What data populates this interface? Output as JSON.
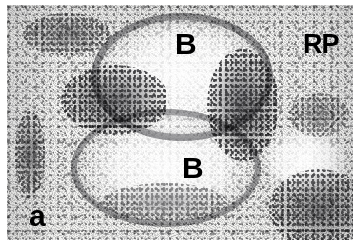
{
  "figure": {
    "panel_label": "a",
    "caption_type": "autoradiograph-micrograph",
    "width_px": 360,
    "height_px": 246,
    "background_color": "#ffffff",
    "plate_tone": "#f4f4f2",
    "grain_color": "#15151a"
  },
  "annotations": [
    {
      "id": "b-top",
      "text": "B",
      "meaning": "B-cell follicle",
      "x": 168,
      "y": 24,
      "font_size": 30
    },
    {
      "id": "rp",
      "text": "RP",
      "meaning": "red pulp",
      "x": 296,
      "y": 26,
      "font_size": 27
    },
    {
      "id": "b-mid",
      "text": "B",
      "meaning": "B-cell follicle",
      "x": 175,
      "y": 148,
      "font_size": 30
    },
    {
      "id": "panel",
      "text": "a",
      "meaning": "panel letter",
      "x": 22,
      "y": 196,
      "font_size": 30
    }
  ],
  "regions": {
    "pale_follicles": [
      {
        "name": "upper-follicle",
        "cx": 175,
        "cy": 72,
        "rx": 78,
        "ry": 56
      },
      {
        "name": "lower-follicle",
        "cx": 160,
        "cy": 165,
        "rx": 82,
        "ry": 52
      }
    ],
    "dense_clusters": [
      {
        "name": "left-central-cluster",
        "cx": 112,
        "cy": 95,
        "rx": 52,
        "ry": 32,
        "opacity": 0.78
      },
      {
        "name": "right-central-cluster",
        "cx": 238,
        "cy": 100,
        "rx": 34,
        "ry": 52,
        "opacity": 0.8
      },
      {
        "name": "top-left-cluster",
        "cx": 62,
        "cy": 30,
        "rx": 40,
        "ry": 18,
        "opacity": 0.62
      },
      {
        "name": "left-edge-streak",
        "cx": 24,
        "cy": 150,
        "rx": 12,
        "ry": 40,
        "opacity": 0.66
      },
      {
        "name": "bottom-right-cluster",
        "cx": 318,
        "cy": 206,
        "rx": 44,
        "ry": 34,
        "opacity": 0.72
      },
      {
        "name": "right-mid-cluster",
        "cx": 318,
        "cy": 112,
        "rx": 26,
        "ry": 18,
        "opacity": 0.52
      },
      {
        "name": "bottom-centre-arc",
        "cx": 160,
        "cy": 200,
        "rx": 56,
        "ry": 14,
        "opacity": 0.5
      }
    ],
    "grain_rings": [
      {
        "name": "upper-follicle-ring",
        "cx": 175,
        "cy": 74,
        "rx": 84,
        "ry": 60,
        "thickness": 7
      },
      {
        "name": "lower-follicle-ring",
        "cx": 158,
        "cy": 166,
        "rx": 88,
        "ry": 56,
        "thickness": 6
      }
    ]
  }
}
